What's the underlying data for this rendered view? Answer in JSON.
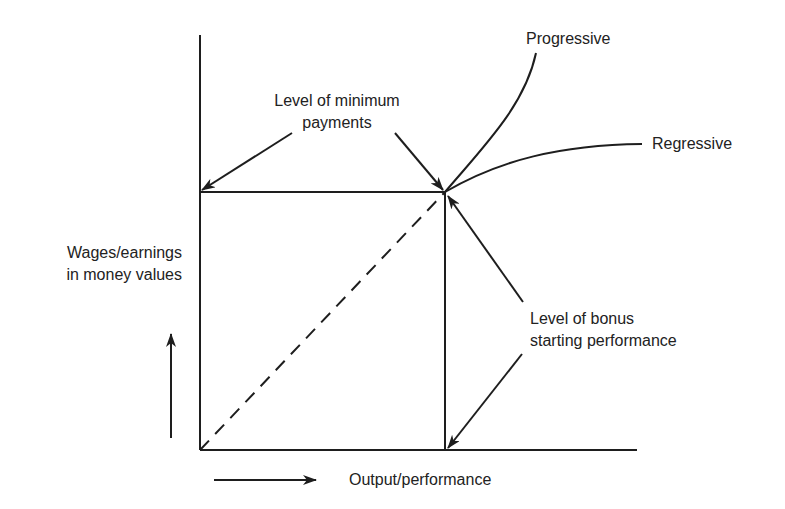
{
  "diagram": {
    "type": "wage-payment-schemes",
    "axes": {
      "y_label_line1": "Wages/earnings",
      "y_label_line2": "in money values",
      "x_label": "Output/performance"
    },
    "annotations": {
      "min_payments_line1": "Level of minimum",
      "min_payments_line2": "payments",
      "bonus_start_line1": "Level of bonus",
      "bonus_start_line2": "starting performance"
    },
    "curves": {
      "progressive": "Progressive",
      "regressive": "Regressive"
    },
    "colors": {
      "line": "#1e1e1e",
      "background": "#ffffff"
    }
  }
}
